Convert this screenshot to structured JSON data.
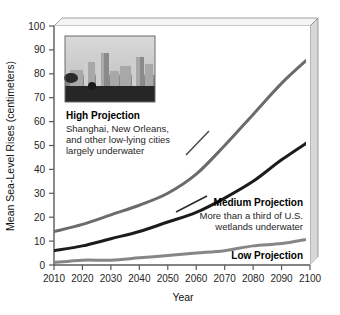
{
  "chart_data": {
    "type": "line",
    "title": "",
    "xlabel": "Year",
    "ylabel": "Mean Sea-Level Rises (centimeters)",
    "xlim": [
      2010,
      2100
    ],
    "ylim": [
      0,
      100
    ],
    "grid": false,
    "legend_position": "inline-annotations",
    "x": [
      2010,
      2020,
      2030,
      2040,
      2050,
      2060,
      2070,
      2080,
      2090,
      2100
    ],
    "xticklabels": [
      "2010",
      "2020",
      "2030",
      "2040",
      "2050",
      "2060",
      "2070",
      "2080",
      "2090",
      "2100"
    ],
    "yticklabels": [
      "0",
      "10",
      "20",
      "30",
      "40",
      "50",
      "60",
      "70",
      "80",
      "90",
      "100"
    ],
    "yticks": [
      0,
      10,
      20,
      30,
      40,
      50,
      60,
      70,
      80,
      90,
      100
    ],
    "series": [
      {
        "name": "High Projection",
        "color": "#6b6b6b",
        "width": 3,
        "values": [
          14,
          17,
          21,
          25,
          30,
          38,
          50,
          63,
          76,
          87
        ]
      },
      {
        "name": "Medium Projection",
        "color": "#1c1c1c",
        "width": 3,
        "values": [
          6,
          8,
          11,
          14,
          18,
          22,
          28,
          35,
          44,
          52
        ]
      },
      {
        "name": "Low Projection",
        "color": "#868686",
        "width": 3,
        "values": [
          1,
          2,
          2,
          3,
          4,
          5,
          6,
          8,
          9,
          11
        ]
      }
    ],
    "annotations": [
      {
        "id": "high-projection",
        "title": "High Projection",
        "lines": [
          "Shanghai, New Orleans,",
          "and other low-lying cities",
          "largely underwater"
        ],
        "has_leader_line": true
      },
      {
        "id": "medium-projection",
        "title": "Medium Projection",
        "lines": [
          "More than a third of U.S.",
          "wetlands underwater"
        ],
        "has_leader_line": true
      },
      {
        "id": "low-projection",
        "title": "Low Projection",
        "lines": [],
        "has_leader_line": false
      }
    ],
    "inset_image": {
      "name": "flooded-city-skyline-photo",
      "description": "Grayscale photograph of a city skyline with dark flooded foreground"
    }
  },
  "colors": {
    "high": "#6b6b6b",
    "medium": "#1c1c1c",
    "low": "#868686",
    "axis": "#5a5a5a",
    "wall": "#d6d6d6",
    "background": "#ffffff"
  }
}
